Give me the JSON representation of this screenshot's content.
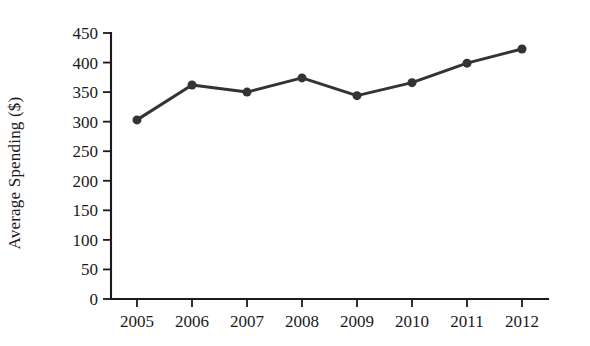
{
  "chart_data": {
    "type": "line",
    "title": "",
    "xlabel": "",
    "ylabel": "Average Spending ($)",
    "categories": [
      "2005",
      "2006",
      "2007",
      "2008",
      "2009",
      "2010",
      "2011",
      "2012"
    ],
    "values": [
      303,
      362,
      350,
      374,
      344,
      366,
      399,
      423
    ],
    "series": [
      {
        "name": "Average Spending",
        "values": [
          303,
          362,
          350,
          374,
          344,
          366,
          399,
          423
        ]
      }
    ],
    "ylim": [
      0,
      450
    ],
    "xlim": [
      "2005",
      "2012"
    ],
    "yticks": [
      0,
      50,
      100,
      150,
      200,
      250,
      300,
      350,
      400,
      450
    ],
    "ytick_labels": [
      "0",
      "50",
      "100",
      "150",
      "200",
      "250",
      "300",
      "350",
      "400",
      "450"
    ],
    "xtick_labels": [
      "2005",
      "2006",
      "2007",
      "2008",
      "2009",
      "2010",
      "2011",
      "2012"
    ],
    "grid": false,
    "legend": false,
    "legend_position": "none",
    "marker": "circle",
    "marker_size": 9,
    "line_width": 3,
    "colors": {
      "series": "#333333",
      "axis": "#1a1a1a",
      "text": "#1a1a1a",
      "background": "#ffffff"
    }
  },
  "layout": {
    "plot_left": 111,
    "plot_right": 548,
    "plot_top": 33,
    "plot_bottom": 299
  }
}
